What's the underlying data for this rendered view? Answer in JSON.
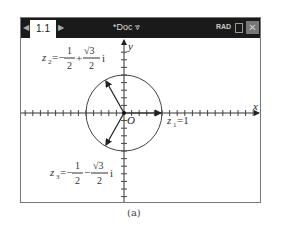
{
  "titlebar": {
    "tab_label": "1.1",
    "prev_arrow": "◀",
    "next_arrow": "▶",
    "doc_title": "*Doc",
    "doc_dropdown": "⩔",
    "mode": "RAD",
    "close": "✕"
  },
  "graph": {
    "x_axis_label": "x",
    "y_axis_label": "y",
    "origin_label": "O",
    "z1": {
      "label": "z",
      "sub": "1",
      "eq": "=1"
    },
    "z2": {
      "label": "z",
      "sub": "2",
      "eq": "=−",
      "num1": "1",
      "den1": "2",
      "op": "+",
      "num2": "√3",
      "den2": "2",
      "unit": "i"
    },
    "z3": {
      "label": "z",
      "sub": "3",
      "eq": "=−",
      "num1": "1",
      "den1": "2",
      "op": "−",
      "num2": "√3",
      "den2": "2",
      "unit": "i"
    }
  },
  "caption": "(a)"
}
